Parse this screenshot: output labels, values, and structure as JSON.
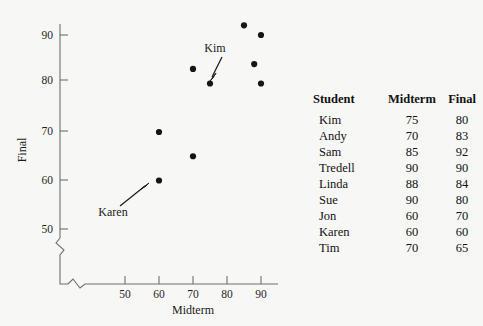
{
  "chart_data": {
    "type": "scatter",
    "title": "",
    "xlabel": "Midterm",
    "ylabel": "Final",
    "xlim": [
      43,
      95
    ],
    "ylim": [
      45,
      95
    ],
    "xticks": [
      50,
      60,
      70,
      80,
      90
    ],
    "yticks": [
      50,
      60,
      70,
      80,
      90
    ],
    "grid": false,
    "axis_break_x": true,
    "axis_break_y": true,
    "legend": "none",
    "points": [
      {
        "label": "Kim",
        "x": 75,
        "y": 80
      },
      {
        "label": "Andy",
        "x": 70,
        "y": 83
      },
      {
        "label": "Sam",
        "x": 85,
        "y": 92
      },
      {
        "label": "Tredell",
        "x": 90,
        "y": 90
      },
      {
        "label": "Linda",
        "x": 88,
        "y": 84
      },
      {
        "label": "Sue",
        "x": 90,
        "y": 80
      },
      {
        "label": "Jon",
        "x": 60,
        "y": 70
      },
      {
        "label": "Karen",
        "x": 60,
        "y": 60
      },
      {
        "label": "Tim",
        "x": 70,
        "y": 65
      }
    ],
    "annotations": [
      {
        "text": "Kim",
        "point_x": 75,
        "point_y": 80,
        "text_x": 71.5,
        "text_y": 88.5
      },
      {
        "text": "Karen",
        "point_x": 60,
        "point_y": 60,
        "text_x": 56.5,
        "text_y": 53.5
      }
    ],
    "marker_color": "#151515",
    "axis_color": "#6f6f6f"
  },
  "axes": {
    "x_label": "Midterm",
    "y_label": "Final",
    "x_tick_labels": [
      "50",
      "60",
      "70",
      "80",
      "90"
    ],
    "y_tick_labels": [
      "50",
      "60",
      "70",
      "80",
      "90"
    ]
  },
  "annotations": {
    "kim": "Kim",
    "karen": "Karen"
  },
  "table": {
    "headers": [
      "Student",
      "Midterm",
      "Final"
    ],
    "rows": [
      {
        "student": "Kim",
        "midterm": "75",
        "final": "80"
      },
      {
        "student": "Andy",
        "midterm": "70",
        "final": "83"
      },
      {
        "student": "Sam",
        "midterm": "85",
        "final": "92"
      },
      {
        "student": "Tredell",
        "midterm": "90",
        "final": "90"
      },
      {
        "student": "Linda",
        "midterm": "88",
        "final": "84"
      },
      {
        "student": "Sue",
        "midterm": "90",
        "final": "80"
      },
      {
        "student": "Jon",
        "midterm": "60",
        "final": "70"
      },
      {
        "student": "Karen",
        "midterm": "60",
        "final": "60"
      },
      {
        "student": "Tim",
        "midterm": "70",
        "final": "65"
      }
    ]
  }
}
